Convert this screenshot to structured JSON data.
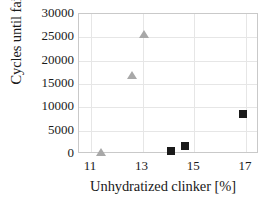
{
  "chart_data": {
    "type": "scatter",
    "title": "",
    "xlabel": "Unhydratized clinker [%]",
    "ylabel": "Cycles until failure",
    "xlim": [
      10.54,
      17.5
    ],
    "ylim": [
      0,
      30000
    ],
    "xticks": [
      11,
      13,
      15,
      17
    ],
    "xtick_labels": [
      "11",
      "13",
      "15",
      "17"
    ],
    "yticks": [
      0,
      5000,
      10000,
      15000,
      20000,
      25000,
      30000
    ],
    "ytick_labels": [
      "0",
      "5000",
      "10000",
      "15000",
      "20000",
      "25000",
      "30000"
    ],
    "grid": true,
    "grid_axis": "both",
    "legend_position": "top-right",
    "series": [
      {
        "name": "binder",
        "marker": "square",
        "color": "#1a1a1a",
        "points": [
          {
            "x": 14.1,
            "y": 700
          },
          {
            "x": 14.65,
            "y": 1800
          },
          {
            "x": 16.9,
            "y": 8500
          }
        ]
      },
      {
        "name": "UHPC",
        "marker": "triangle",
        "color": "#a8a8a8",
        "points": [
          {
            "x": 11.4,
            "y": 400
          },
          {
            "x": 12.6,
            "y": 17000
          },
          {
            "x": 13.05,
            "y": 25700
          }
        ]
      }
    ]
  },
  "legend": {
    "entries": [
      {
        "label": "binder",
        "marker": "square-marker-icon"
      },
      {
        "label": "UHPC",
        "marker": "triangle-marker-icon"
      }
    ]
  },
  "colors": {
    "binder": "#1a1a1a",
    "uhpc": "#a8a8a8",
    "grid": "#e6e6e6",
    "frame": "#c9c9c9",
    "text": "#1a1a1a",
    "background": "#ffffff"
  }
}
